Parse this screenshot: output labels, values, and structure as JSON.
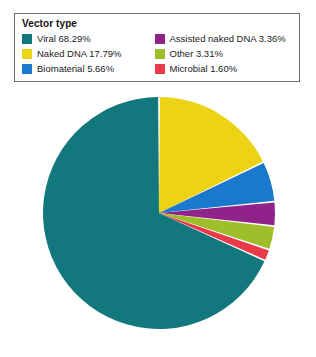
{
  "legend": {
    "title": "Vector type",
    "columns": [
      [
        {
          "label": "Viral 68.29%",
          "name": "viral",
          "color": "#12787E"
        },
        {
          "label": "Naked DNA 17.79%",
          "name": "naked-dna",
          "color": "#EDD316"
        },
        {
          "label": "Biomaterial 5.66%",
          "name": "biomaterial",
          "color": "#1A78CD"
        }
      ],
      [
        {
          "label": "Assisted naked DNA 3.36%",
          "name": "assisted-naked-dna",
          "color": "#8F2389"
        },
        {
          "label": "Other 3.31%",
          "name": "other",
          "color": "#9FBE2C"
        },
        {
          "label": "Microbial 1.60%",
          "name": "microbial",
          "color": "#E93A4A"
        }
      ]
    ]
  },
  "chart_data": {
    "type": "pie",
    "title": "Vector type",
    "categories": [
      "Viral",
      "Naked DNA",
      "Biomaterial",
      "Assisted naked DNA",
      "Other",
      "Microbial"
    ],
    "values": [
      68.29,
      17.79,
      5.66,
      3.36,
      3.31,
      1.6
    ],
    "unit": "%",
    "colors": [
      "#12787E",
      "#EDD316",
      "#1A78CD",
      "#8F2389",
      "#9FBE2C",
      "#E93A4A"
    ],
    "labels": [
      "Viral 68.29%",
      "Naked DNA 17.79%",
      "Biomaterial 5.66%",
      "Assisted naked DNA 3.36%",
      "Other 3.31%",
      "Microbial 1.60%"
    ],
    "start_angle_deg": 0,
    "direction": "clockwise",
    "draw_order": [
      "Naked DNA",
      "Biomaterial",
      "Assisted naked DNA",
      "Other",
      "Microbial",
      "Viral"
    ],
    "slice_gap_deg": 0.9,
    "legend_position": "top",
    "grid": false,
    "xlabel": "",
    "ylabel": ""
  }
}
